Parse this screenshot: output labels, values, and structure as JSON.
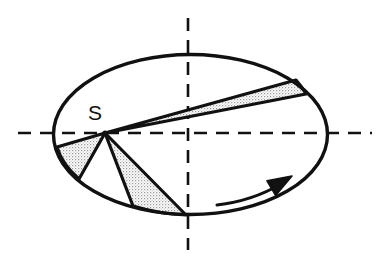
{
  "figure": {
    "background_color": "#ffffff",
    "stroke_color": "#111111",
    "stipple_color": "#d8d8d8",
    "labels": {
      "point_s": "S"
    },
    "ellipse": {
      "cx": 190.5,
      "cy": 134.5,
      "rx": 137,
      "ry": 80,
      "stroke_width": 3.4
    },
    "axes": {
      "horizontal": {
        "y": 133,
        "x_start": 18,
        "x_end": 372,
        "dash": "13 9",
        "stroke_width": 2.6
      },
      "vertical": {
        "x": 188,
        "y_start": 18,
        "y_end": 250,
        "dash": "13 9",
        "stroke_width": 2.6
      }
    },
    "vertex": {
      "x": 105,
      "y": 133
    },
    "label_position": {
      "x": 95,
      "y": 120
    },
    "wedges": [
      {
        "name": "upper-right-sliver",
        "edge_a": {
          "x": 296,
          "y": 80
        },
        "edge_b": {
          "x": 306,
          "y": 94
        },
        "filled": true
      },
      {
        "name": "left-wedge",
        "edge_a": {
          "x": 57,
          "y": 147
        },
        "edge_b": {
          "x": 79,
          "y": 179
        },
        "filled": true
      },
      {
        "name": "lower-middle-wedge",
        "edge_a": {
          "x": 133,
          "y": 206
        },
        "edge_b": {
          "x": 186,
          "y": 215
        },
        "filled": true
      }
    ],
    "rotation_arrow": {
      "name": "rotation-direction-arrow",
      "start": {
        "x": 217,
        "y": 205
      },
      "control": {
        "x": 252,
        "y": 201
      },
      "end": {
        "x": 281,
        "y": 184
      },
      "head_tip": {
        "x": 292,
        "y": 176
      },
      "direction": "clockwise-in-view",
      "stroke_width": 3.0
    }
  }
}
